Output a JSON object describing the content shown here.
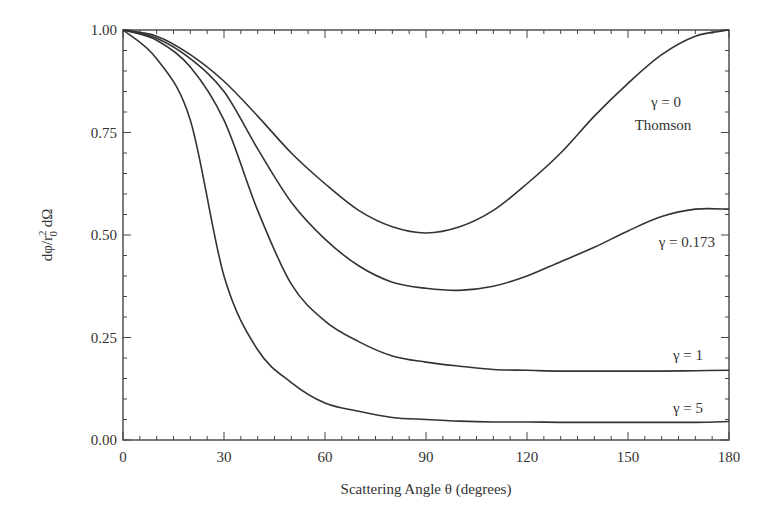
{
  "chart_data": {
    "type": "line",
    "title": "",
    "xlabel": "Scattering Angle θ (degrees)",
    "ylabel": "dφ/r₀² dΩ",
    "xlim": [
      0,
      180
    ],
    "ylim": [
      0,
      1.0
    ],
    "grid": false,
    "legend": "inline labels",
    "x_ticks": [
      "0",
      "30",
      "60",
      "90",
      "120",
      "150",
      "180"
    ],
    "y_ticks": [
      "0.00",
      "0.25",
      "0.50",
      "0.75",
      "1.00"
    ],
    "x": [
      0,
      10,
      20,
      30,
      40,
      50,
      60,
      70,
      80,
      90,
      100,
      110,
      120,
      130,
      140,
      150,
      160,
      170,
      180
    ],
    "series": [
      {
        "name": "γ = 0 (Thomson)",
        "label_line1": "γ = 0",
        "label_line2": "Thomson",
        "values": [
          1.0,
          0.985,
          0.94,
          0.875,
          0.79,
          0.7,
          0.625,
          0.56,
          0.52,
          0.505,
          0.52,
          0.56,
          0.625,
          0.7,
          0.79,
          0.87,
          0.94,
          0.985,
          1.0
        ]
      },
      {
        "name": "γ = 0.173",
        "label_line1": "γ = 0.173",
        "values": [
          1.0,
          0.98,
          0.93,
          0.85,
          0.71,
          0.58,
          0.49,
          0.425,
          0.385,
          0.37,
          0.365,
          0.375,
          0.4,
          0.435,
          0.47,
          0.51,
          0.545,
          0.563,
          0.563
        ]
      },
      {
        "name": "γ = 1",
        "label_line1": "γ = 1",
        "values": [
          1.0,
          0.975,
          0.91,
          0.78,
          0.56,
          0.38,
          0.29,
          0.24,
          0.205,
          0.19,
          0.18,
          0.172,
          0.17,
          0.168,
          0.168,
          0.168,
          0.168,
          0.169,
          0.17
        ]
      },
      {
        "name": "γ = 5",
        "label_line1": "γ = 5",
        "values": [
          1.0,
          0.93,
          0.78,
          0.4,
          0.22,
          0.14,
          0.09,
          0.07,
          0.055,
          0.05,
          0.046,
          0.044,
          0.044,
          0.043,
          0.043,
          0.043,
          0.043,
          0.043,
          0.045
        ]
      }
    ]
  },
  "labels": {
    "xlabel": "Scattering Angle θ (degrees)",
    "ylabel_main": "dφ/r",
    "ylabel_sup": "2",
    "ylabel_sub": "0",
    "ylabel_tail": " dΩ",
    "gamma0_line1": "γ = 0",
    "gamma0_line2": "Thomson",
    "gamma0173": "γ = 0.173",
    "gamma1": "γ = 1",
    "gamma5": "γ = 5"
  },
  "style": {
    "line_color": "#333333",
    "axis_color": "#444444"
  }
}
